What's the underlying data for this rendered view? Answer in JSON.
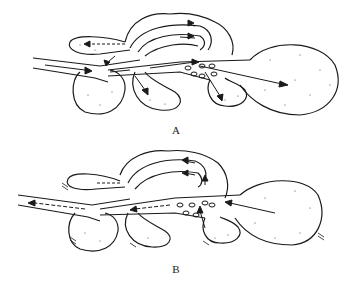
{
  "diagram": {
    "type": "bird respiratory system (air sacs and lungs)",
    "panels": [
      {
        "id": "A",
        "label": "A",
        "phase": "inspiration",
        "arrow_style": "solid (inflow) with dashed anterior flow"
      },
      {
        "id": "B",
        "label": "B",
        "phase": "expiration",
        "arrow_style": "dashed outflow through trachea"
      }
    ],
    "colors": {
      "line": "#1a1a1a",
      "background": "#ffffff",
      "stipple": "#444444"
    }
  }
}
